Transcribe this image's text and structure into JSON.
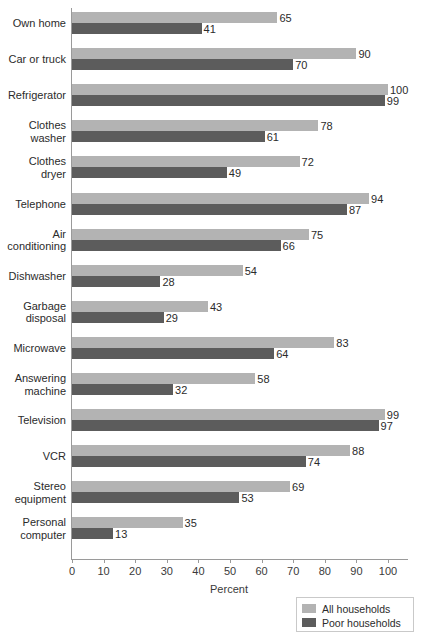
{
  "chart_data": {
    "type": "bar",
    "orientation": "horizontal",
    "title": "",
    "xlabel": "Percent",
    "ylabel": "",
    "xlim": [
      0,
      106
    ],
    "xticks": [
      0,
      10,
      20,
      30,
      40,
      50,
      60,
      70,
      80,
      90,
      100
    ],
    "grid": false,
    "legend_position": "bottom-right",
    "categories": [
      "Own home",
      "Car or truck",
      "Refrigerator",
      "Clothes\nwasher",
      "Clothes\ndryer",
      "Telephone",
      "Air\nconditioning",
      "Dishwasher",
      "Garbage\ndisposal",
      "Microwave",
      "Answering\nmachine",
      "Television",
      "VCR",
      "Stereo\nequipment",
      "Personal\ncomputer"
    ],
    "series": [
      {
        "name": "All households",
        "color": "#b3b3b3",
        "values": [
          65,
          90,
          100,
          78,
          72,
          94,
          75,
          54,
          43,
          83,
          58,
          99,
          88,
          69,
          35
        ]
      },
      {
        "name": "Poor households",
        "color": "#5c5c5c",
        "values": [
          41,
          70,
          99,
          61,
          49,
          87,
          66,
          28,
          29,
          64,
          32,
          97,
          74,
          53,
          13
        ]
      }
    ]
  },
  "axis": {
    "x_title": "Percent",
    "tick_labels": [
      "0",
      "10",
      "20",
      "30",
      "40",
      "50",
      "60",
      "70",
      "80",
      "90",
      "100"
    ]
  },
  "legend": {
    "items": [
      {
        "label": "All households",
        "swatch": "all"
      },
      {
        "label": "Poor households",
        "swatch": "poor"
      }
    ]
  }
}
